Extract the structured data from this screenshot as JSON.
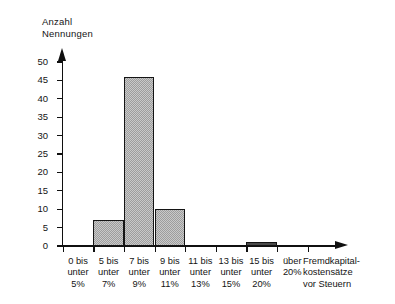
{
  "chart_data": {
    "type": "bar",
    "title": "",
    "subtitle": "",
    "ylabel_line1": "Anzahl",
    "ylabel_line2": "Nennungen",
    "xlabel_line1": "Fremdkapital-",
    "xlabel_line2": "kostensätze",
    "xlabel_line3": "vor Steuern",
    "categories": [
      "0 bis unter 5%",
      "5 bis unter 7%",
      "7 bis unter 9%",
      "9 bis unter 11%",
      "11 bis unter 13%",
      "13 bis unter 15%",
      "15 bis unter 20%",
      "über 20%"
    ],
    "category_lines": [
      [
        "0 bis",
        "unter",
        "5%"
      ],
      [
        "5 bis",
        "unter",
        "7%"
      ],
      [
        "7 bis",
        "unter",
        "9%"
      ],
      [
        "9 bis",
        "unter",
        "11%"
      ],
      [
        "11 bis",
        "unter",
        "13%"
      ],
      [
        "13 bis",
        "unter",
        "15%"
      ],
      [
        "15 bis",
        "unter",
        "20%"
      ],
      [
        "über",
        "20%",
        ""
      ]
    ],
    "values": [
      0,
      7,
      46,
      10,
      0,
      0,
      1,
      0
    ],
    "ylim": [
      0,
      50
    ],
    "yticks": [
      0,
      5,
      10,
      15,
      20,
      25,
      30,
      35,
      40,
      45,
      50
    ],
    "ytick_labels": [
      "0",
      "5",
      "10",
      "15",
      "20",
      "25",
      "30",
      "35",
      "40",
      "45",
      "50"
    ],
    "grid": false,
    "legend": "none",
    "bar_fill_color": "#9d9d9d",
    "bar_edge_color": "#141414",
    "axis_color": "#101010",
    "background_color": "#ffffff"
  }
}
